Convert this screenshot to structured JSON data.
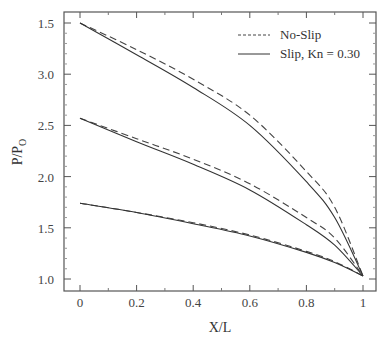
{
  "chart_data": {
    "type": "line",
    "title": "",
    "xlabel": "X/L",
    "ylabel": "P/P",
    "ylabel_subscript": "O",
    "xlim": [
      0,
      1
    ],
    "ylim": [
      0.9,
      3.6
    ],
    "x_ticks": [
      0,
      0.2,
      0.4,
      0.6,
      0.8,
      1
    ],
    "x_tick_labels": [
      "0",
      "0.2",
      "0.4",
      "0.6",
      "0.8",
      "1"
    ],
    "y_ticks": [
      1.0,
      1.5,
      2.0,
      2.5,
      3.0,
      3.5
    ],
    "y_tick_labels": [
      "1.0",
      "1.5",
      "2.0",
      "2.5",
      "3.0",
      "1.5"
    ],
    "grid": false,
    "legend_position": "upper right",
    "legend": [
      {
        "label": "No-Slip",
        "style": "dashed"
      },
      {
        "label": "Slip, Kn = 0.30",
        "style": "solid"
      }
    ],
    "x": [
      0,
      0.2,
      0.4,
      0.6,
      0.8,
      0.9,
      1.0
    ],
    "series": [
      {
        "name": "No-Slip (inlet 3.5)",
        "style": "dashed",
        "values": [
          3.5,
          3.24,
          2.95,
          2.6,
          2.05,
          1.7,
          1.03
        ]
      },
      {
        "name": "Slip, Kn = 0.30 (inlet 3.5)",
        "style": "solid",
        "values": [
          3.5,
          3.19,
          2.87,
          2.5,
          1.95,
          1.6,
          1.03
        ]
      },
      {
        "name": "No-Slip (inlet 2.57)",
        "style": "dashed",
        "values": [
          2.57,
          2.37,
          2.17,
          1.93,
          1.6,
          1.4,
          1.03
        ]
      },
      {
        "name": "Slip, Kn = 0.30 (inlet 2.57)",
        "style": "solid",
        "values": [
          2.57,
          2.34,
          2.12,
          1.87,
          1.53,
          1.33,
          1.03
        ]
      },
      {
        "name": "No-Slip (inlet 1.74)",
        "style": "dashed",
        "values": [
          1.74,
          1.65,
          1.55,
          1.43,
          1.27,
          1.17,
          1.03
        ]
      },
      {
        "name": "Slip, Kn = 0.30 (inlet 1.74)",
        "style": "solid",
        "values": [
          1.74,
          1.65,
          1.54,
          1.42,
          1.26,
          1.16,
          1.03
        ]
      }
    ]
  }
}
